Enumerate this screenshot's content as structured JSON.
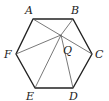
{
  "diagram": {
    "vertices": [
      {
        "name": "A",
        "x": 33,
        "y": 19,
        "label_x": 25,
        "label_y": 14
      },
      {
        "name": "B",
        "x": 73,
        "y": 19,
        "label_x": 73,
        "label_y": 14
      },
      {
        "name": "C",
        "x": 92,
        "y": 54,
        "label_x": 95,
        "label_y": 58
      },
      {
        "name": "D",
        "x": 73,
        "y": 88,
        "label_x": 70,
        "label_y": 100
      },
      {
        "name": "E",
        "x": 35,
        "y": 88,
        "label_x": 26,
        "label_y": 100
      },
      {
        "name": "F",
        "x": 16,
        "y": 54,
        "label_x": 4,
        "label_y": 58
      }
    ],
    "point_q": {
      "name": "Q",
      "x": 61,
      "y": 35,
      "label_x": 63,
      "label_y": 54
    },
    "segments": [
      "AC",
      "BQ",
      "QF",
      "QE",
      "QD"
    ]
  }
}
